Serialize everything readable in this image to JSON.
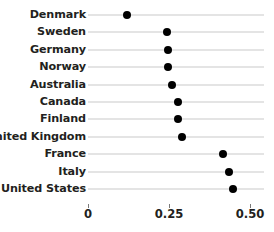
{
  "chart_data": {
    "type": "scatter",
    "title": "",
    "subtitle": "",
    "xlabel": "",
    "ylabel": "",
    "orientation": "horizontal",
    "grid": true,
    "legend": null,
    "xlim": [
      0,
      0.5
    ],
    "xticks": [
      0,
      0.25,
      0.5
    ],
    "xtick_labels": [
      "0",
      "0.25",
      "0.50"
    ],
    "categories": [
      "Denmark",
      "Sweden",
      "Germany",
      "Norway",
      "Australia",
      "Canada",
      "Finland",
      "United Kingdom",
      "France",
      "Italy",
      "United States"
    ],
    "values": [
      0.12,
      0.245,
      0.246,
      0.246,
      0.26,
      0.278,
      0.278,
      0.29,
      0.418,
      0.436,
      0.448
    ],
    "marker": "filled-circle",
    "marker_color": "#000000",
    "gridline_color": "#c9c9c9"
  },
  "axis": {
    "ticks": [
      {
        "label": "0",
        "value": 0
      },
      {
        "label": "0.25",
        "value": 0.25
      },
      {
        "label": "0.50",
        "value": 0.5
      }
    ]
  },
  "caption": {
    "clipped_text": ""
  }
}
